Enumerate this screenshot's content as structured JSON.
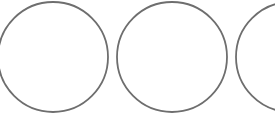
{
  "canvas": {
    "width": 275,
    "height": 118,
    "background_color": "#ffffff",
    "description": "three-outlined-circles-in-a-row"
  },
  "style": {
    "stroke_color": "#6e6e6e",
    "stroke_width": 1.8,
    "fill": "none"
  },
  "shapes": [
    {
      "name": "circle-left",
      "cx": 53,
      "cy": 57,
      "r": 55,
      "clipped": "left-edge"
    },
    {
      "name": "circle-middle",
      "cx": 172,
      "cy": 57,
      "r": 55,
      "clipped": "none"
    },
    {
      "name": "circle-right",
      "cx": 291,
      "cy": 57,
      "r": 55,
      "clipped": "right-edge"
    }
  ]
}
